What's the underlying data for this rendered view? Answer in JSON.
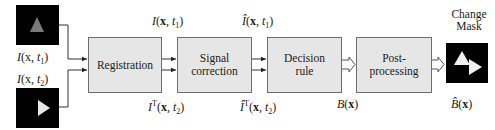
{
  "diagram": {
    "type": "block-diagram",
    "inputs": [
      {
        "id": "input-t1",
        "label_fn": "I",
        "label_var": "x",
        "label_time": "t",
        "label_sub": "1",
        "icon": "gray-up-triangle-icon"
      },
      {
        "id": "input-t2",
        "label_fn": "I",
        "label_var": "x",
        "label_time": "t",
        "label_sub": "2",
        "icon": "white-right-triangle-icon"
      }
    ],
    "blocks": [
      {
        "id": "registration",
        "label": "Registration"
      },
      {
        "id": "signal-correction",
        "label_line1": "Signal",
        "label_line2": "correction"
      },
      {
        "id": "decision-rule",
        "label_line1": "Decision",
        "label_line2": "rule"
      },
      {
        "id": "post-processing",
        "label_line1": "Post-",
        "label_line2": "processing"
      }
    ],
    "edge_labels": {
      "reg_out_top": {
        "fn": "I",
        "var": "x",
        "time": "t",
        "sub": "1"
      },
      "reg_out_bottom": {
        "fn": "I",
        "sup": "T",
        "var": "x",
        "time": "t",
        "sub": "2"
      },
      "sc_out_top": {
        "fn": "Î",
        "var": "x",
        "time": "t",
        "sub": "1"
      },
      "sc_out_bottom": {
        "fn": "Î",
        "sup": "T",
        "var": "x",
        "time": "t",
        "sub": "2"
      },
      "dr_out": {
        "fn": "B",
        "var": "x"
      },
      "output": {
        "fn": "B̂",
        "var": "x"
      }
    },
    "output": {
      "caption_line1": "Change",
      "caption_line2": "Mask",
      "icon": "change-mask-icon"
    },
    "colors": {
      "block_fill": "#e6e6e6",
      "block_border": "#6e6e6e",
      "thumb_bg": "#000000",
      "gray_triangle": "#7a7a7a",
      "white_triangle": "#e8e8e8",
      "wire": "#333333"
    }
  }
}
